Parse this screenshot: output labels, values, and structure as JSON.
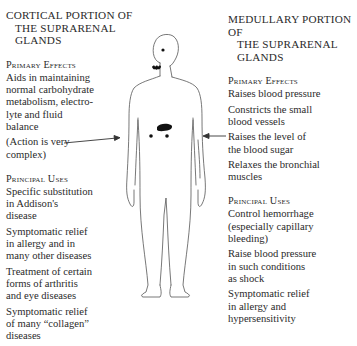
{
  "left": {
    "title": [
      "CORTICAL PORTION OF",
      "THE SUPRARENAL",
      "GLANDS"
    ],
    "primary_effects": {
      "heading": "Primary Effects",
      "items": [
        [
          "Aids in maintaining",
          "normal carbohydrate",
          "metabolism, electro-",
          "lyte and fluid",
          "balance"
        ],
        [
          "(Action is very",
          "complex)"
        ]
      ]
    },
    "principal_uses": {
      "heading": "Principal Uses",
      "items": [
        [
          "Specific substitution",
          "in Addison's",
          "disease"
        ],
        [
          "Symptomatic relief",
          "in allergy and in",
          "many other diseases"
        ],
        [
          "Treatment of certain",
          "forms of arthritis",
          "and eye diseases"
        ],
        [
          "Symptomatic relief",
          "of many “collagen”",
          "diseases"
        ]
      ]
    }
  },
  "right": {
    "title": [
      "MEDULLARY PORTION OF",
      "THE SUPRARENAL",
      "GLANDS"
    ],
    "primary_effects": {
      "heading": "Primary Effects",
      "items": [
        [
          "Raises blood pressure"
        ],
        [
          "Constricts the small",
          "blood vessels"
        ],
        [
          "Raises the level of",
          "the blood sugar"
        ],
        [
          "Relaxes the bronchial",
          "muscles"
        ]
      ]
    },
    "principal_uses": {
      "heading": "Principal Uses",
      "items": [
        [
          "Control hemorrhage",
          "(especially capillary",
          "bleeding)"
        ],
        [
          "Raise blood pressure",
          "in such conditions",
          "as shock"
        ],
        [
          "Symptomatic relief",
          "in allergy and",
          "hypersensitivity"
        ]
      ]
    }
  },
  "figure": {
    "arrows": [
      "cortical arrow pointing to body",
      "medullary arrow pointing to body"
    ]
  }
}
